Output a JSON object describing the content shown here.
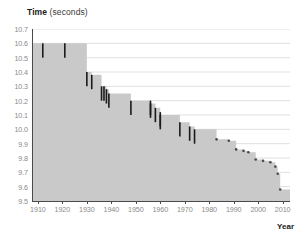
{
  "chart": {
    "title_bold": "Time",
    "title_rest": " (seconds)",
    "xlabel": "Year"
  },
  "chart_data": {
    "type": "area",
    "title": "Time (seconds)",
    "xlabel": "Year",
    "ylabel": "Time (seconds)",
    "xlim": [
      1908,
      2013
    ],
    "ylim": [
      9.5,
      10.7
    ],
    "grid": true,
    "legend": null,
    "yticks": [
      "10.7",
      "10.6",
      "10.5",
      "10.4",
      "10.3",
      "10.2",
      "10.1",
      "10.0",
      "9.9",
      "9.8",
      "9.7",
      "9.6",
      "9.5"
    ],
    "ytick_values": [
      10.7,
      10.6,
      10.5,
      10.4,
      10.3,
      10.2,
      10.1,
      10.0,
      9.9,
      9.8,
      9.7,
      9.6,
      9.5
    ],
    "xticks": [
      "1910",
      "1920",
      "1930",
      "1940",
      "1950",
      "1960",
      "1970",
      "1980",
      "1990",
      "2000",
      "2010"
    ],
    "xtick_values": [
      1910,
      1920,
      1930,
      1940,
      1950,
      1960,
      1970,
      1980,
      1990,
      2000,
      2010
    ],
    "series": [
      {
        "name": "100 m world record progression",
        "marker": "vertical-tick",
        "x": [
          1912,
          1921,
          1930,
          1932,
          1936,
          1956,
          1960,
          1968,
          1983,
          1988,
          1991,
          1994,
          1996,
          1999,
          2002,
          2005,
          2007,
          2008,
          2009
        ],
        "values": [
          10.6,
          10.4,
          10.3,
          10.3,
          10.2,
          10.1,
          10.0,
          9.95,
          9.93,
          9.92,
          9.86,
          9.85,
          9.84,
          9.79,
          9.78,
          9.77,
          9.74,
          9.69,
          9.58
        ]
      }
    ],
    "records": [
      {
        "year": 1912,
        "time": 10.6
      },
      {
        "year": 1921,
        "time": 10.6
      },
      {
        "year": 1930,
        "time": 10.4
      },
      {
        "year": 1932,
        "time": 10.38
      },
      {
        "year": 1936,
        "time": 10.3
      },
      {
        "year": 1937,
        "time": 10.3
      },
      {
        "year": 1938,
        "time": 10.28
      },
      {
        "year": 1939,
        "time": 10.25
      },
      {
        "year": 1948,
        "time": 10.2
      },
      {
        "year": 1956,
        "time": 10.2
      },
      {
        "year": 1956,
        "time": 10.18
      },
      {
        "year": 1958,
        "time": 10.15
      },
      {
        "year": 1960,
        "time": 10.12
      },
      {
        "year": 1960,
        "time": 10.1
      },
      {
        "year": 1968,
        "time": 10.05
      },
      {
        "year": 1972,
        "time": 10.02
      },
      {
        "year": 1974,
        "time": 10.0
      },
      {
        "year": 1983,
        "time": 9.93
      },
      {
        "year": 1988,
        "time": 9.92
      },
      {
        "year": 1991,
        "time": 9.86
      },
      {
        "year": 1994,
        "time": 9.85
      },
      {
        "year": 1996,
        "time": 9.84
      },
      {
        "year": 1999,
        "time": 9.79
      },
      {
        "year": 2002,
        "time": 9.78
      },
      {
        "year": 2005,
        "time": 9.77
      },
      {
        "year": 2007,
        "time": 9.74
      },
      {
        "year": 2008,
        "time": 9.69
      },
      {
        "year": 2009,
        "time": 9.58
      }
    ],
    "colors": {
      "area_fill": "#c9c9c9",
      "record_mark": "#1a1a1a",
      "grid": "#d7d7d7",
      "axis": "#4a4a4a",
      "tick_text": "#8a8a8a"
    }
  }
}
